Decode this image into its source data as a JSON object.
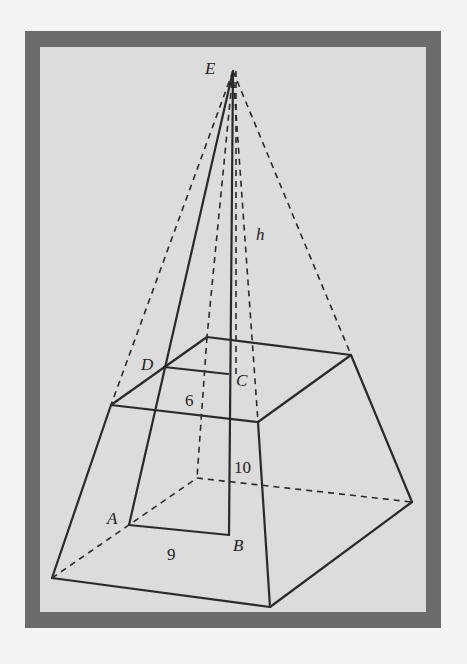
{
  "figure": {
    "vertices": {
      "E": "E",
      "A": "A",
      "B": "B",
      "C": "C",
      "D": "D"
    },
    "labels": {
      "height": "h",
      "top_segment": "6",
      "bottom_segment": "9",
      "slant": "10"
    },
    "colors": {
      "border": "#6b6b6b",
      "background": "#dcdcdc",
      "line": "#2a2a2a"
    }
  }
}
